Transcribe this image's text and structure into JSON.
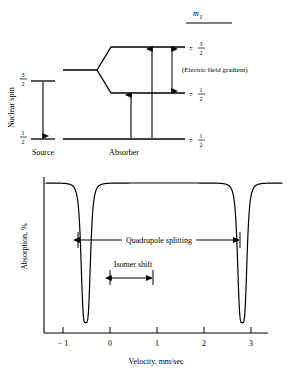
{
  "figure": {
    "type": "moessbauer-spectrum-with-level-diagram"
  },
  "level_diagram": {
    "m_label": "m",
    "m_sub": "I",
    "axis_label": "Nuclear spin",
    "source_label": "Source",
    "absorber_label": "Absorber",
    "efg_label": "(Electric field gradient)",
    "source_levels": [
      {
        "name": "excited",
        "text_num": "3",
        "text_den": "2"
      },
      {
        "name": "ground",
        "text_num": "1",
        "text_den": "2"
      }
    ],
    "absorber_levels": [
      {
        "name": "excited-upper",
        "sign": "±",
        "num": "3",
        "den": "2"
      },
      {
        "name": "excited-lower",
        "sign": "±",
        "num": "1",
        "den": "2"
      },
      {
        "name": "ground",
        "sign": "±",
        "num": "1",
        "den": "2"
      }
    ]
  },
  "chart_data": {
    "type": "line",
    "title": "",
    "xlabel": "Velocity, mm/sec",
    "ylabel": "Absorption, %",
    "xlim": [
      -1.45,
      3.3
    ],
    "ylim": [
      0,
      1.08
    ],
    "grid": false,
    "legend": "none",
    "xticks": [
      -1,
      0,
      1,
      2,
      3
    ],
    "xticklabels": [
      "− 1",
      "0",
      "1",
      "2",
      "3"
    ],
    "yticks": [],
    "yticklabels": [],
    "baseline": 1.0,
    "peaks": [
      {
        "name": "peak-left",
        "center": -0.65,
        "depth": 0.97,
        "halfwidth": 0.1
      },
      {
        "name": "peak-right",
        "center": 2.5,
        "depth": 0.97,
        "halfwidth": 0.1
      }
    ],
    "annotations": [
      {
        "name": "quadrupole-splitting",
        "label": "Quadrupole splitting",
        "from": -0.65,
        "to": 2.5
      },
      {
        "name": "isomer-shift",
        "label": "Isomer shift",
        "from": 0.0,
        "to": 0.92
      }
    ]
  }
}
